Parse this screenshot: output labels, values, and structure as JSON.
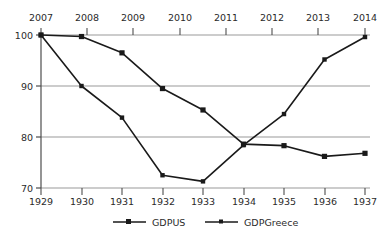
{
  "chart_data": {
    "type": "line",
    "title": "",
    "xlabel": "",
    "ylabel": "",
    "ylim": [
      70,
      100
    ],
    "yticks": [
      70,
      80,
      90,
      100
    ],
    "grid": true,
    "legend_position": "bottom",
    "x_axis_bottom": {
      "name": "year-greece",
      "ticks": [
        "1929",
        "1930",
        "1931",
        "1932",
        "1933",
        "1934",
        "1935",
        "1936",
        "1937"
      ]
    },
    "x_axis_top": {
      "name": "year-us",
      "ticks": [
        "2007",
        "2008",
        "2009",
        "2010",
        "2011",
        "2012",
        "2013",
        "2014"
      ]
    },
    "x": [
      1929,
      1930,
      1931,
      1932,
      1933,
      1934,
      1935,
      1936,
      1937
    ],
    "series": [
      {
        "name": "GDPUS",
        "marker": "square",
        "color": "#1a1a1a",
        "values": [
          100.0,
          99.7,
          96.5,
          89.5,
          85.3,
          78.6,
          78.3,
          76.2,
          76.8
        ]
      },
      {
        "name": "GDPGreece",
        "marker": "square",
        "color": "#1a1a1a",
        "values": [
          100.0,
          90.0,
          83.8,
          72.5,
          71.3,
          78.4,
          84.5,
          95.2,
          99.6
        ]
      }
    ],
    "legend": [
      {
        "label": "GDPUS"
      },
      {
        "label": "GDPGreece"
      }
    ],
    "colors": {
      "line": "#1a1a1a",
      "grid": "#9a9a9a",
      "axis": "#4d4d4d",
      "text": "#2b2b2b",
      "background": "#ffffff"
    }
  }
}
